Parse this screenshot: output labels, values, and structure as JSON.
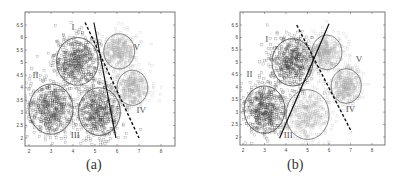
{
  "chart_data": [
    {
      "type": "scatter",
      "panel": "a",
      "caption": "(a)",
      "title": "",
      "xlabel": "",
      "ylabel": "",
      "xlim": [
        1.8,
        8.6
      ],
      "ylim": [
        1.7,
        6.9
      ],
      "xticks": [
        2,
        3,
        4,
        5,
        6,
        7,
        8
      ],
      "yticks": [
        2,
        2.5,
        3,
        3.5,
        4,
        4.5,
        5,
        5.5,
        6,
        6.5
      ],
      "grid": false,
      "marker": "square",
      "clusters": [
        {
          "label": "I",
          "cx": 4.2,
          "cy": 5.05,
          "r": 0.95,
          "shade": "dark",
          "label_x": 4.0,
          "label_y": 6.3
        },
        {
          "label": "II",
          "cx": 3.0,
          "cy": 3.15,
          "r": 1.0,
          "shade": "dark",
          "label_x": 2.3,
          "label_y": 4.4
        },
        {
          "label": "III",
          "cx": 5.2,
          "cy": 3.05,
          "r": 0.95,
          "shade": "dark",
          "label_x": 4.1,
          "label_y": 2.0
        },
        {
          "label": "V",
          "cx": 6.1,
          "cy": 5.45,
          "r": 0.7,
          "shade": "light",
          "label_x": 6.9,
          "label_y": 5.5
        },
        {
          "label": "IV",
          "cx": 6.7,
          "cy": 4.0,
          "r": 0.7,
          "shade": "light",
          "label_x": 7.1,
          "label_y": 3.0
        }
      ],
      "lines": [
        {
          "style": "solid",
          "x": [
            4.95,
            5.95
          ],
          "y": [
            6.6,
            2.0
          ]
        },
        {
          "style": "dashed",
          "x": [
            4.55,
            7.0
          ],
          "y": [
            6.6,
            2.0
          ]
        }
      ],
      "pixel_map": {
        "x0": 2,
        "px0": 29,
        "x1": 8,
        "px1": 161,
        "y0": 2,
        "py0": 138,
        "y1": 6.5,
        "py1": 25,
        "frame": [
          25,
          12,
          175,
          146
        ]
      }
    },
    {
      "type": "scatter",
      "panel": "b",
      "caption": "(b)",
      "title": "",
      "xlabel": "",
      "ylabel": "",
      "xlim": [
        1.8,
        8.6
      ],
      "ylim": [
        1.7,
        6.9
      ],
      "xticks": [
        2,
        3,
        4,
        5,
        6,
        7,
        8
      ],
      "yticks": [
        2,
        2.5,
        3,
        3.5,
        4,
        4.5,
        5,
        5.5,
        6,
        6.5
      ],
      "grid": false,
      "marker": "square",
      "clusters": [
        {
          "label": "I",
          "cx": 4.3,
          "cy": 5.0,
          "r": 0.95,
          "shade": "dark",
          "label_x": 3.1,
          "label_y": 5.8
        },
        {
          "label": "II",
          "cx": 3.0,
          "cy": 3.1,
          "r": 0.95,
          "shade": "dark",
          "label_x": 2.3,
          "label_y": 4.4
        },
        {
          "label": "III",
          "cx": 5.0,
          "cy": 2.9,
          "r": 1.0,
          "shade": "light",
          "label_x": 4.1,
          "label_y": 1.95
        },
        {
          "label": "V",
          "cx": 5.9,
          "cy": 5.4,
          "r": 0.7,
          "shade": "light",
          "label_x": 7.4,
          "label_y": 5.0
        },
        {
          "label": "IV",
          "cx": 6.8,
          "cy": 4.05,
          "r": 0.7,
          "shade": "light",
          "label_x": 7.0,
          "label_y": 3.0
        }
      ],
      "lines": [
        {
          "style": "solid",
          "x": [
            3.7,
            6.0
          ],
          "y": [
            1.95,
            6.55
          ]
        },
        {
          "style": "dashed",
          "x": [
            4.5,
            7.05
          ],
          "y": [
            6.5,
            2.2
          ]
        }
      ],
      "pixel_map": {
        "x0": 2,
        "px0": 43,
        "x1": 8,
        "px1": 172,
        "y0": 2,
        "py0": 137,
        "y1": 6.5,
        "py1": 25,
        "frame": [
          40,
          12,
          185,
          145
        ]
      }
    }
  ]
}
